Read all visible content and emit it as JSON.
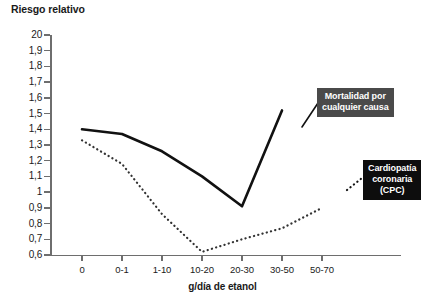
{
  "chart_data": {
    "type": "line",
    "title": "Riesgo relativo",
    "ylabel": "Riesgo relativo",
    "xlabel": "g/día de etanol",
    "categories": [
      "0",
      "0-1",
      "1-10",
      "10-20",
      "20-30",
      "30-50",
      "50-70"
    ],
    "yticks": [
      "20",
      "1,9",
      "1,8",
      "1,7",
      "1,6",
      "1,5",
      "1,4",
      "1,3",
      "1,2",
      "1,1",
      "1",
      "0,9",
      "0,8",
      "0,7",
      "0,6"
    ],
    "ytick_values": [
      2.0,
      1.9,
      1.8,
      1.7,
      1.6,
      1.5,
      1.4,
      1.3,
      1.2,
      1.1,
      1.0,
      0.9,
      0.8,
      0.7,
      0.6
    ],
    "ylim": [
      0.6,
      2.0
    ],
    "grid": false,
    "legend_position": "annotations",
    "series": [
      {
        "name": "Mortalidad por cualquier causa",
        "style": "solid",
        "color": "#111111",
        "values": [
          1.4,
          1.37,
          1.26,
          1.1,
          0.91,
          1.52,
          null
        ]
      },
      {
        "name": "Cardiopatía coronaria (CPC)",
        "style": "dotted",
        "color": "#333333",
        "values": [
          1.33,
          1.18,
          0.86,
          0.62,
          0.7,
          0.77,
          0.9
        ]
      }
    ],
    "annotations": [
      {
        "id": "mortality",
        "lines": [
          "Mortalidad por",
          "cualquier causa"
        ],
        "background": "#4a4a4a",
        "text_color": "#ffffff"
      },
      {
        "id": "chd",
        "lines": [
          "Cardiopatía",
          "coronaria",
          "(CPC)"
        ],
        "background": "#0d0d0d",
        "text_color": "#ffffff"
      }
    ]
  },
  "axes": {
    "axis_color": "#6e6e6e"
  }
}
